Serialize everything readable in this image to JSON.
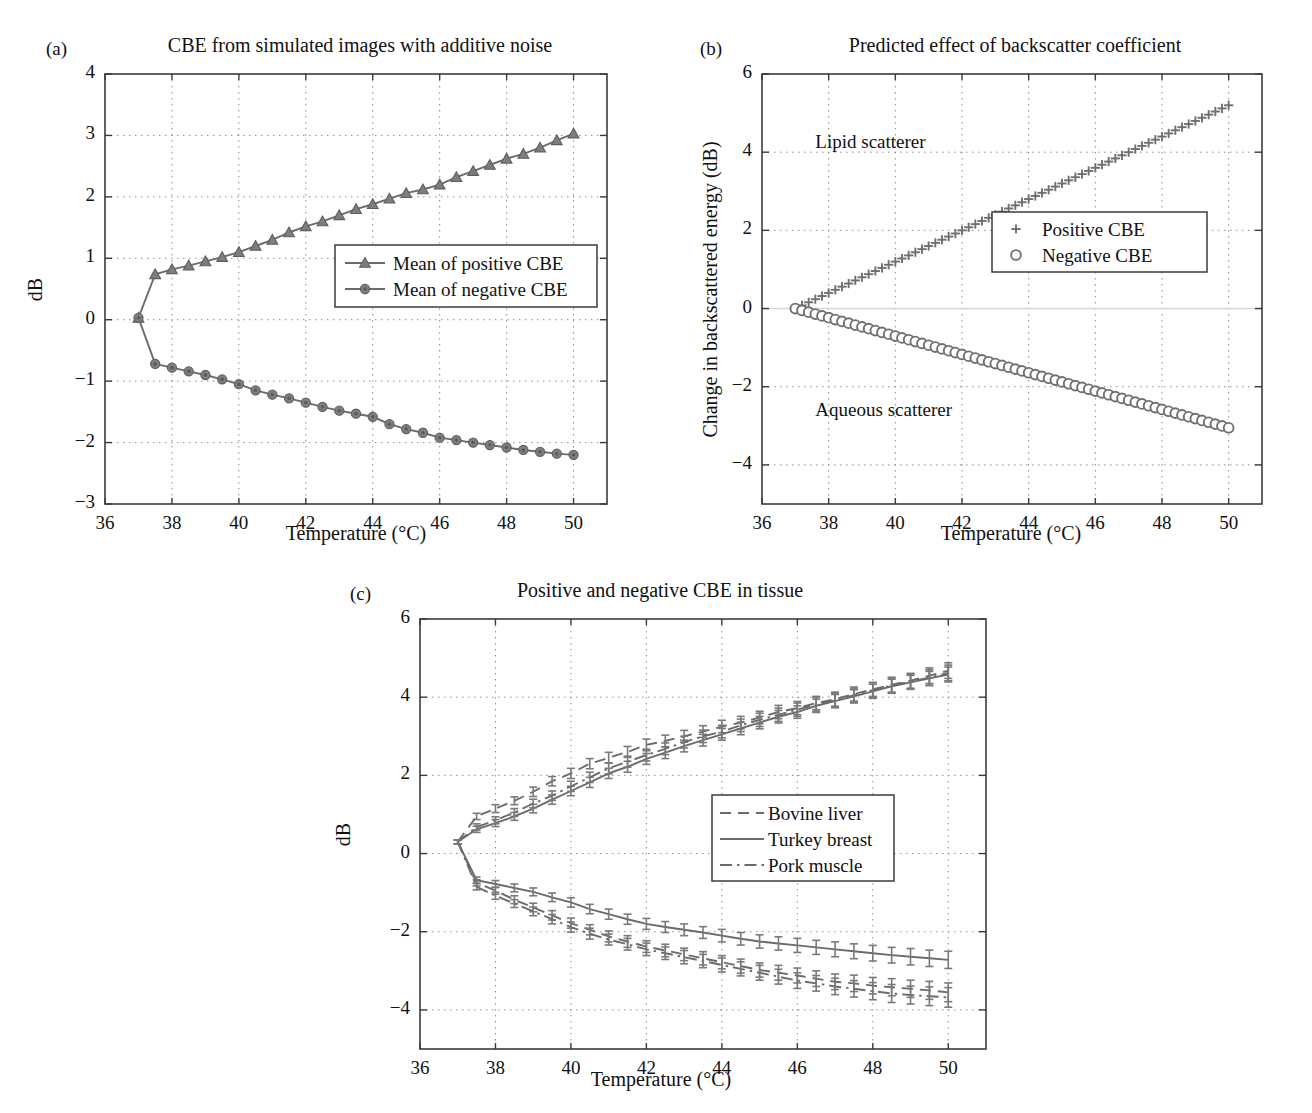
{
  "figure": {
    "panels": [
      {
        "label": "(a)",
        "title": "CBE from simulated images with additive noise",
        "xlabel": "Temperature (°C)",
        "ylabel": "dB"
      },
      {
        "label": "(b)",
        "title": "Predicted effect of backscatter coefficient",
        "xlabel": "Temperature (°C)",
        "ylabel": "Change in backscattered energy (dB)"
      },
      {
        "label": "(c)",
        "title": "Positive and negative CBE in tissue",
        "xlabel": "Temperature (°C)",
        "ylabel": "dB"
      }
    ],
    "colors": {
      "data": "#6b6b6b",
      "marker_fill": "#7d7d7d",
      "axis": "#3b3b3b",
      "grid": "#8d8d8d",
      "text": "#111111"
    }
  },
  "chart_data": [
    {
      "panel": "a",
      "type": "line",
      "title": "CBE from simulated images with additive noise",
      "xlabel": "Temperature (°C)",
      "ylabel": "dB",
      "xlim": [
        36,
        51
      ],
      "ylim": [
        -3,
        4
      ],
      "xticks": [
        36,
        38,
        40,
        42,
        44,
        46,
        48,
        50
      ],
      "yticks": [
        -3,
        -2,
        -1,
        0,
        1,
        2,
        3,
        4
      ],
      "xtick_labels": [
        "36",
        "38",
        "40",
        "42",
        "44",
        "46",
        "48",
        "50"
      ],
      "ytick_labels": [
        "-3",
        "-2",
        "-1",
        "0",
        "1",
        "2",
        "3",
        "4"
      ],
      "grid": true,
      "legend_position": "center-right",
      "x": [
        37,
        37.5,
        38,
        38.5,
        39,
        39.5,
        40,
        40.5,
        41,
        41.5,
        42,
        42.5,
        43,
        43.5,
        44,
        44.5,
        45,
        45.5,
        46,
        46.5,
        47,
        47.5,
        48,
        48.5,
        49,
        49.5,
        50
      ],
      "series": [
        {
          "name": "Mean of positive CBE",
          "marker": "triangle",
          "linestyle": "solid",
          "values": [
            0.03,
            0.74,
            0.82,
            0.88,
            0.95,
            1.02,
            1.1,
            1.2,
            1.3,
            1.42,
            1.52,
            1.6,
            1.7,
            1.8,
            1.88,
            1.97,
            2.06,
            2.12,
            2.2,
            2.32,
            2.42,
            2.52,
            2.62,
            2.7,
            2.8,
            2.92,
            3.03
          ]
        },
        {
          "name": "Mean of negative CBE",
          "marker": "circle",
          "linestyle": "solid",
          "values": [
            0.03,
            -0.72,
            -0.78,
            -0.84,
            -0.9,
            -0.97,
            -1.05,
            -1.15,
            -1.22,
            -1.28,
            -1.35,
            -1.42,
            -1.48,
            -1.53,
            -1.58,
            -1.7,
            -1.78,
            -1.84,
            -1.92,
            -1.96,
            -2.0,
            -2.04,
            -2.08,
            -2.12,
            -2.15,
            -2.18,
            -2.2
          ]
        }
      ]
    },
    {
      "panel": "b",
      "type": "line",
      "title": "Predicted effect of backscatter coefficient",
      "xlabel": "Temperature (°C)",
      "ylabel": "Change in backscattered energy (dB)",
      "xlim": [
        36,
        51
      ],
      "ylim": [
        -5,
        6
      ],
      "xticks": [
        36,
        38,
        40,
        42,
        44,
        46,
        48,
        50
      ],
      "yticks": [
        -4,
        -2,
        0,
        2,
        4,
        6
      ],
      "xtick_labels": [
        "36",
        "38",
        "40",
        "42",
        "44",
        "46",
        "48",
        "50"
      ],
      "ytick_labels": [
        "-4",
        "-2",
        "0",
        "2",
        "4",
        "6"
      ],
      "grid": true,
      "legend_position": "center-right",
      "annotations": [
        {
          "text": "Lipid scatterer",
          "x": 37.6,
          "y": 4.1
        },
        {
          "text": "Aqueous scatterer",
          "x": 37.6,
          "y": -2.75
        }
      ],
      "x_start": 37,
      "x_end": 50,
      "n_points": 66,
      "series": [
        {
          "name": "Positive CBE",
          "marker": "plus",
          "y_start": 0.0,
          "y_end": 5.2
        },
        {
          "name": "Negative CBE",
          "marker": "circle-open",
          "y_start": 0.0,
          "y_end": -3.05
        }
      ]
    },
    {
      "panel": "c",
      "type": "line",
      "title": "Positive and negative CBE in tissue",
      "xlabel": "Temperature (°C)",
      "ylabel": "dB",
      "xlim": [
        36,
        51
      ],
      "ylim": [
        -5,
        6
      ],
      "xticks": [
        36,
        38,
        40,
        42,
        44,
        46,
        48,
        50
      ],
      "yticks": [
        -4,
        -2,
        0,
        2,
        4,
        6
      ],
      "xtick_labels": [
        "36",
        "38",
        "40",
        "42",
        "44",
        "46",
        "48",
        "50"
      ],
      "ytick_labels": [
        "-4",
        "-2",
        "0",
        "2",
        "4",
        "6"
      ],
      "grid": true,
      "legend_position": "center-right",
      "error_bars": true,
      "x": [
        37,
        37.5,
        38,
        38.5,
        39,
        39.5,
        40,
        40.5,
        41,
        41.5,
        42,
        42.5,
        43,
        43.5,
        44,
        44.5,
        45,
        45.5,
        46,
        46.5,
        47,
        47.5,
        48,
        48.5,
        49,
        49.5,
        50
      ],
      "series": [
        {
          "name": "Bovine liver",
          "linestyle": "dashed",
          "branch": "positive",
          "values": [
            0.3,
            0.95,
            1.15,
            1.35,
            1.58,
            1.85,
            2.05,
            2.3,
            2.45,
            2.6,
            2.78,
            2.88,
            3.0,
            3.12,
            3.25,
            3.35,
            3.48,
            3.62,
            3.72,
            3.85,
            3.95,
            4.08,
            4.2,
            4.32,
            4.42,
            4.55,
            4.68
          ],
          "errors": [
            0.05,
            0.08,
            0.1,
            0.1,
            0.12,
            0.12,
            0.13,
            0.13,
            0.14,
            0.14,
            0.15,
            0.15,
            0.15,
            0.15,
            0.16,
            0.16,
            0.16,
            0.17,
            0.17,
            0.17,
            0.18,
            0.18,
            0.18,
            0.19,
            0.19,
            0.2,
            0.2
          ]
        },
        {
          "name": "Turkey breast",
          "linestyle": "solid",
          "branch": "positive",
          "values": [
            0.3,
            0.62,
            0.78,
            0.95,
            1.15,
            1.38,
            1.6,
            1.82,
            2.05,
            2.22,
            2.42,
            2.58,
            2.75,
            2.9,
            3.05,
            3.2,
            3.35,
            3.5,
            3.62,
            3.78,
            3.9,
            4.02,
            4.15,
            4.28,
            4.38,
            4.48,
            4.58
          ],
          "errors": [
            0.05,
            0.08,
            0.09,
            0.1,
            0.11,
            0.12,
            0.12,
            0.13,
            0.13,
            0.14,
            0.14,
            0.15,
            0.15,
            0.15,
            0.15,
            0.16,
            0.16,
            0.16,
            0.16,
            0.17,
            0.17,
            0.17,
            0.18,
            0.18,
            0.18,
            0.18,
            0.19
          ]
        },
        {
          "name": "Pork muscle",
          "linestyle": "dashdot",
          "branch": "positive",
          "values": [
            0.3,
            0.68,
            0.85,
            1.05,
            1.28,
            1.48,
            1.72,
            1.95,
            2.18,
            2.35,
            2.52,
            2.68,
            2.85,
            3.0,
            3.12,
            3.28,
            3.42,
            3.55,
            3.68,
            3.82,
            3.92,
            4.05,
            4.18,
            4.3,
            4.4,
            4.5,
            4.62
          ],
          "errors": [
            0.05,
            0.08,
            0.09,
            0.1,
            0.11,
            0.12,
            0.13,
            0.13,
            0.14,
            0.14,
            0.15,
            0.15,
            0.15,
            0.16,
            0.16,
            0.16,
            0.17,
            0.17,
            0.17,
            0.18,
            0.18,
            0.18,
            0.19,
            0.19,
            0.19,
            0.2,
            0.2
          ]
        },
        {
          "name": "Bovine liver",
          "linestyle": "dashed",
          "branch": "negative",
          "values": [
            0.3,
            -0.75,
            -0.95,
            -1.18,
            -1.38,
            -1.58,
            -1.78,
            -1.95,
            -2.12,
            -2.25,
            -2.38,
            -2.48,
            -2.58,
            -2.68,
            -2.78,
            -2.88,
            -2.98,
            -3.05,
            -3.12,
            -3.2,
            -3.28,
            -3.32,
            -3.38,
            -3.42,
            -3.46,
            -3.5,
            -3.55
          ],
          "errors": [
            0.05,
            0.08,
            0.09,
            0.1,
            0.11,
            0.12,
            0.13,
            0.13,
            0.14,
            0.15,
            0.15,
            0.16,
            0.16,
            0.17,
            0.17,
            0.18,
            0.18,
            0.19,
            0.19,
            0.2,
            0.2,
            0.21,
            0.21,
            0.22,
            0.22,
            0.23,
            0.24
          ]
        },
        {
          "name": "Turkey breast",
          "linestyle": "solid",
          "branch": "negative",
          "values": [
            0.3,
            -0.68,
            -0.78,
            -0.88,
            -0.98,
            -1.12,
            -1.25,
            -1.42,
            -1.55,
            -1.68,
            -1.8,
            -1.88,
            -1.95,
            -2.02,
            -2.1,
            -2.18,
            -2.25,
            -2.3,
            -2.35,
            -2.4,
            -2.45,
            -2.5,
            -2.55,
            -2.6,
            -2.64,
            -2.68,
            -2.72
          ],
          "errors": [
            0.05,
            0.08,
            0.09,
            0.1,
            0.1,
            0.11,
            0.12,
            0.12,
            0.13,
            0.13,
            0.14,
            0.14,
            0.15,
            0.15,
            0.16,
            0.16,
            0.17,
            0.17,
            0.18,
            0.18,
            0.19,
            0.19,
            0.2,
            0.2,
            0.21,
            0.21,
            0.22
          ]
        },
        {
          "name": "Pork muscle",
          "linestyle": "dashdot",
          "branch": "negative",
          "values": [
            0.3,
            -0.85,
            -1.08,
            -1.28,
            -1.48,
            -1.68,
            -1.88,
            -2.05,
            -2.2,
            -2.32,
            -2.45,
            -2.55,
            -2.65,
            -2.75,
            -2.85,
            -2.95,
            -3.05,
            -3.15,
            -3.25,
            -3.32,
            -3.4,
            -3.46,
            -3.52,
            -3.58,
            -3.62,
            -3.65,
            -3.68
          ],
          "errors": [
            0.05,
            0.08,
            0.09,
            0.1,
            0.11,
            0.12,
            0.13,
            0.14,
            0.14,
            0.15,
            0.16,
            0.16,
            0.17,
            0.17,
            0.18,
            0.18,
            0.19,
            0.19,
            0.2,
            0.2,
            0.21,
            0.21,
            0.22,
            0.23,
            0.23,
            0.24,
            0.25
          ]
        }
      ]
    }
  ]
}
